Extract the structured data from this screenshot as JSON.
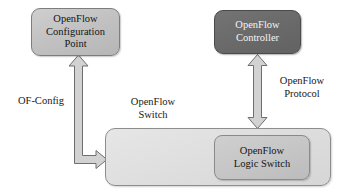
{
  "diagram": {
    "background_color": "#ffffff",
    "nodes": {
      "config_point": {
        "label": "OpenFlow\nConfiguration\nPoint",
        "fill_color": "#c2c2c2",
        "text_color": "#141414"
      },
      "controller": {
        "label": "OpenFlow\nController",
        "fill_color": "#6b6b6b",
        "text_color": "#f4f4f4"
      },
      "switch_box": {
        "label": "",
        "fill_color": "#dedede",
        "text_color": "#141414"
      },
      "logic_switch": {
        "label": "OpenFlow\nLogic Switch",
        "fill_color": "#c6c6c6",
        "text_color": "#141414"
      }
    },
    "labels": {
      "of_config": "OF-Config",
      "openflow_switch": "OpenFlow\nSwitch",
      "openflow_protocol": "OpenFlow\nProtocol"
    },
    "connectors": {
      "of_config_arrow": {
        "name": "OF-Config",
        "from": "OpenFlow Switch",
        "to": "OpenFlow Configuration Point",
        "direction": "one-way",
        "fill_color": "#d2d2d2",
        "stroke_color": "#6f6f6f"
      },
      "openflow_protocol_arrow": {
        "name": "OpenFlow Protocol",
        "from": "OpenFlow Controller",
        "to": "OpenFlow Switch",
        "direction": "two-way",
        "fill_color": "#d2d2d2",
        "stroke_color": "#6f6f6f"
      }
    }
  }
}
